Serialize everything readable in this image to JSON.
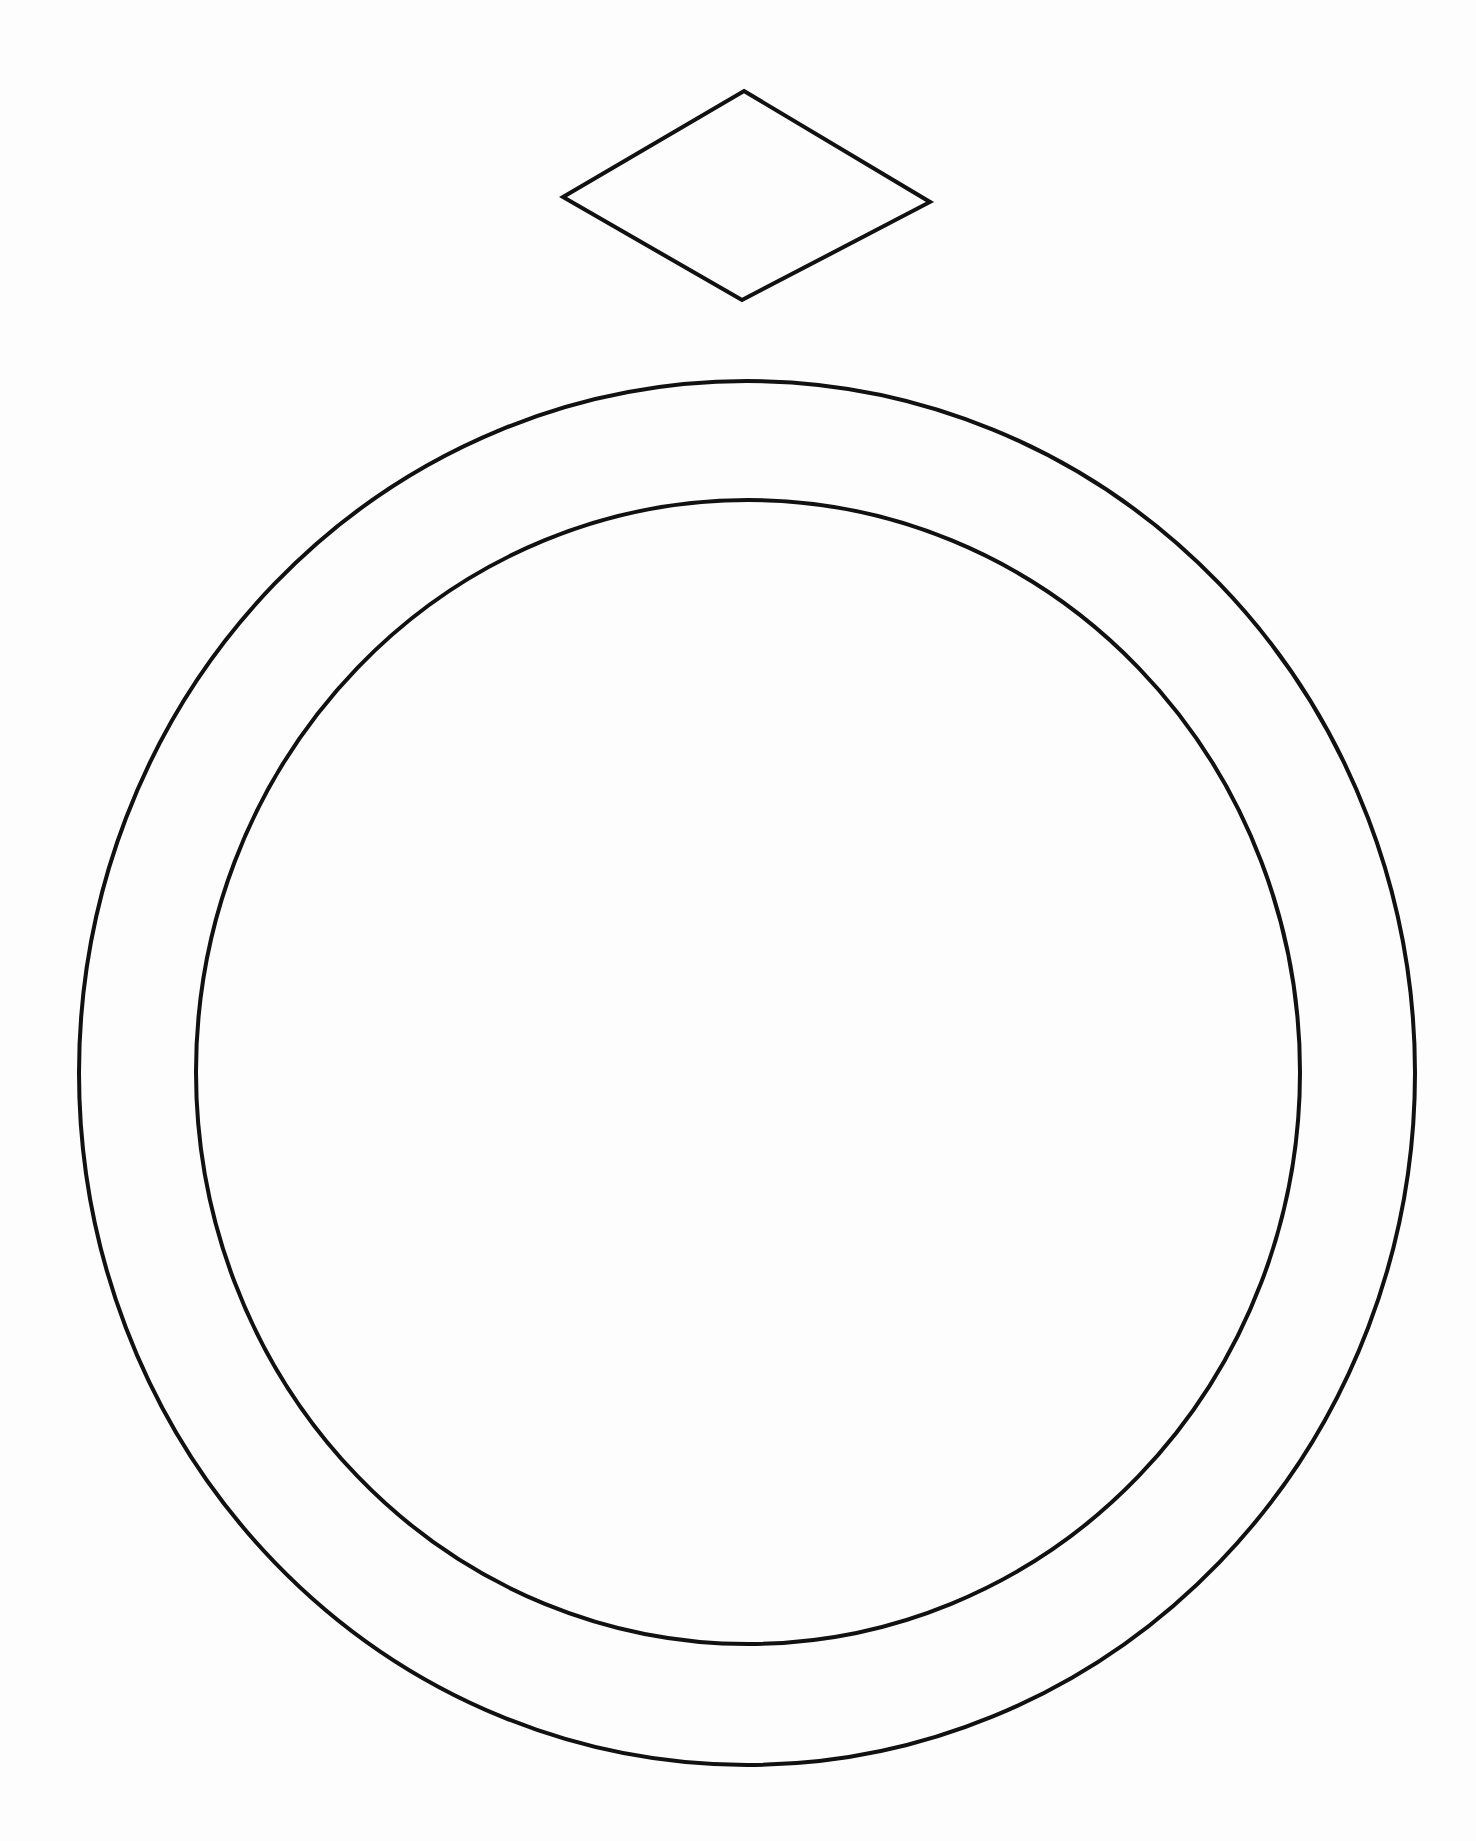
{
  "drawing": {
    "subject": "ring-outline-coloring-page",
    "stroke_color": "#111111",
    "background_color": "#fdfdfd",
    "stroke_width": 4,
    "gem": {
      "shape": "diamond",
      "points": [
        [
          744,
          91
        ],
        [
          930,
          202
        ],
        [
          742,
          300
        ],
        [
          563,
          197
        ]
      ]
    },
    "band_outer": {
      "shape": "ellipse",
      "cx": 747,
      "cy": 1073,
      "rx": 668,
      "ry": 692
    },
    "band_inner": {
      "shape": "ellipse",
      "cx": 748,
      "cy": 1072,
      "rx": 552,
      "ry": 572
    }
  }
}
